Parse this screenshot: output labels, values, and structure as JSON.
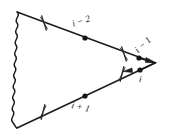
{
  "figure": {
    "background_color": "#ffffff",
    "line_color": "#1d1d1d",
    "label_color": "#1a1a1a",
    "labels": [
      {
        "name": "label-i-minus-2",
        "text": "i − 2",
        "x": 82,
        "y": 24,
        "rotation": -18
      },
      {
        "name": "label-i-minus-1",
        "text": "i − 1",
        "x": 141,
        "y": 46,
        "rotation": -40
      },
      {
        "name": "label-i",
        "text": "i",
        "x": 141,
        "y": 78,
        "rotation": 8
      },
      {
        "name": "label-i-plus-1",
        "text": "i + 1",
        "x": 80,
        "y": 108,
        "rotation": 14
      }
    ],
    "vertices": [
      {
        "name": "vertex-dot-upper",
        "x": 85,
        "y": 38
      },
      {
        "name": "vertex-dot-upper-right",
        "x": 139,
        "y": 58
      },
      {
        "name": "vertex-dot-lower-right",
        "x": 140,
        "y": 70
      },
      {
        "name": "vertex-dot-lower",
        "x": 85,
        "y": 96
      }
    ],
    "tick_marks": [
      {
        "name": "tick-mark-upper-left",
        "x": 44,
        "y": 23,
        "rotation": -18
      },
      {
        "name": "tick-mark-upper-right",
        "x": 124,
        "y": 54,
        "rotation": -18
      },
      {
        "name": "tick-mark-lower-right",
        "x": 123,
        "y": 74,
        "rotation": 14
      },
      {
        "name": "tick-mark-lower-left",
        "x": 43,
        "y": 112,
        "rotation": 14
      }
    ],
    "arrows": [
      {
        "name": "arrowhead-upper-line",
        "x": 150,
        "y": 63,
        "rotation": 20
      },
      {
        "name": "arrowhead-lower-line",
        "x": 130,
        "y": 66,
        "rotation": -195
      }
    ],
    "edges": [
      {
        "name": "edge-photon-wavy-left",
        "style": "wavy",
        "from": [
          17,
          12
        ],
        "to": [
          17,
          128
        ]
      },
      {
        "name": "edge-fermion-upper",
        "style": "straight",
        "from": [
          17,
          12
        ],
        "to": [
          155,
          63
        ]
      },
      {
        "name": "edge-fermion-lower",
        "style": "straight",
        "from": [
          17,
          128
        ],
        "to": [
          155,
          63
        ]
      }
    ]
  }
}
